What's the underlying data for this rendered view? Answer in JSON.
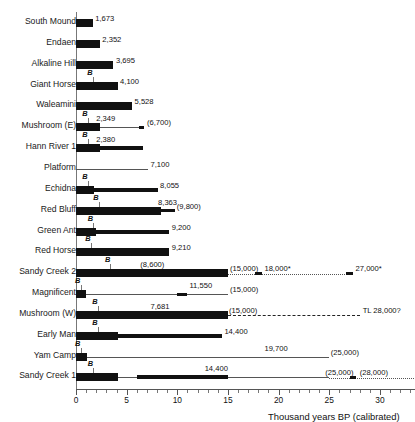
{
  "chart_data": {
    "type": "bar",
    "title": "",
    "xlabel": "Thousand years BP (calibrated)",
    "ylabel": "",
    "xlim": [
      0,
      33.5
    ],
    "xticks": [
      0,
      5,
      10,
      15,
      20,
      25,
      30
    ],
    "xticklabels": [
      "0",
      "5",
      "10",
      "15",
      "20",
      "25",
      "30"
    ],
    "grid": false,
    "legend": null,
    "note": "Horizontal range chart of archaeological site dates; 'B' marks a basal/boundary tick; parenthesised values are uncertain/bracketed estimates; dotted and dashed extensions are inferred older ages.",
    "categories": [
      "South Mound",
      "Endaen",
      "Alkaline Hill",
      "Giant Horse",
      "Waleamini",
      "Mushroom (E)",
      "Hann River 1",
      "Platform",
      "Echidna",
      "Red Bluff",
      "Green Ant",
      "Red Horse",
      "Sandy Creek 2",
      "Magnificent",
      "Mushroom (W)",
      "Early Man",
      "Yam Camp",
      "Sandy Creek 1"
    ],
    "values": [
      1.673,
      2.352,
      3.695,
      4.1,
      5.528,
      2.349,
      2.38,
      7.1,
      8.055,
      8.363,
      9.2,
      9.21,
      15.0,
      11.55,
      15.0,
      14.4,
      19.7,
      14.4
    ],
    "rows": [
      {
        "label": "South Mound",
        "b_marker": null,
        "segments": [
          {
            "kind": "thick",
            "x0": 0,
            "x1": 1.673
          }
        ],
        "labels": [
          {
            "text": "1,673",
            "x": 1.9,
            "align": "left"
          }
        ]
      },
      {
        "label": "Endaen",
        "b_marker": null,
        "segments": [
          {
            "kind": "thick",
            "x0": 0,
            "x1": 2.352
          }
        ],
        "labels": [
          {
            "text": "2,352",
            "x": 2.6,
            "align": "left"
          }
        ]
      },
      {
        "label": "Alkaline Hill",
        "b_marker": null,
        "segments": [
          {
            "kind": "thick",
            "x0": 0,
            "x1": 3.695
          }
        ],
        "labels": [
          {
            "text": "3,695",
            "x": 3.95,
            "align": "left"
          }
        ]
      },
      {
        "label": "Giant Horse",
        "b_marker": 1.65,
        "segments": [
          {
            "kind": "thick",
            "x0": 0,
            "x1": 4.1
          }
        ],
        "labels": [
          {
            "text": "4,100",
            "x": 4.35,
            "align": "left"
          }
        ]
      },
      {
        "label": "Waleamini",
        "b_marker": null,
        "segments": [
          {
            "kind": "thick",
            "x0": 0,
            "x1": 5.528
          }
        ],
        "labels": [
          {
            "text": "5,528",
            "x": 5.78,
            "align": "left"
          }
        ]
      },
      {
        "label": "Mushroom (E)",
        "b_marker": 1.15,
        "segments": [
          {
            "kind": "thick",
            "x0": 0,
            "x1": 2.349
          },
          {
            "kind": "thin",
            "x0": 2.349,
            "x1": 6.7
          },
          {
            "kind": "cap",
            "x0": 6.25,
            "x1": 6.7
          }
        ],
        "labels": [
          {
            "text": "2,349",
            "x": 2.0,
            "align": "left",
            "above": true
          },
          {
            "text": "(6,700)",
            "x": 7.0,
            "align": "left"
          }
        ]
      },
      {
        "label": "Hann River 1",
        "b_marker": 1.15,
        "segments": [
          {
            "kind": "thick",
            "x0": 0,
            "x1": 2.38
          },
          {
            "kind": "med",
            "x0": 2.38,
            "x1": 6.6
          }
        ],
        "labels": [
          {
            "text": "2,380",
            "x": 2.0,
            "align": "left",
            "above": true
          }
        ]
      },
      {
        "label": "Platform",
        "b_marker": null,
        "segments": [
          {
            "kind": "thin",
            "x0": 0,
            "x1": 7.1
          }
        ],
        "labels": [
          {
            "text": "7,100",
            "x": 7.35,
            "align": "left"
          }
        ]
      },
      {
        "label": "Echidna",
        "b_marker": 1.15,
        "segments": [
          {
            "kind": "thick",
            "x0": 0,
            "x1": 1.75
          },
          {
            "kind": "med",
            "x0": 1.75,
            "x1": 8.055
          }
        ],
        "labels": [
          {
            "text": "8,055",
            "x": 8.3,
            "align": "left"
          }
        ]
      },
      {
        "label": "Red Bluff",
        "b_marker": 2.25,
        "segments": [
          {
            "kind": "thick",
            "x0": 0,
            "x1": 8.363
          },
          {
            "kind": "thin",
            "x0": 8.363,
            "x1": 9.8
          },
          {
            "kind": "cap",
            "x0": 8.363,
            "x1": 9.8
          }
        ],
        "labels": [
          {
            "text": "8,363",
            "x": 8.1,
            "align": "left",
            "above": true
          },
          {
            "text": "(9,800)",
            "x": 9.95,
            "align": "left"
          }
        ]
      },
      {
        "label": "Green Ant",
        "b_marker": 1.7,
        "segments": [
          {
            "kind": "thick",
            "x0": 0,
            "x1": 1.95
          },
          {
            "kind": "med",
            "x0": 1.95,
            "x1": 9.2
          }
        ],
        "labels": [
          {
            "text": "9,200",
            "x": 9.45,
            "align": "left"
          }
        ]
      },
      {
        "label": "Red Horse",
        "b_marker": 1.45,
        "segments": [
          {
            "kind": "thick",
            "x0": 0,
            "x1": 9.21
          }
        ],
        "labels": [
          {
            "text": "9,210",
            "x": 9.45,
            "align": "left"
          }
        ]
      },
      {
        "label": "Sandy Creek 2",
        "b_marker": 3.4,
        "segments": [
          {
            "kind": "thick",
            "x0": 0,
            "x1": 15.0
          },
          {
            "kind": "dotted",
            "x0": 15.0,
            "x1": 27.3
          },
          {
            "kind": "cap",
            "x0": 17.7,
            "x1": 18.35
          },
          {
            "kind": "cap",
            "x0": 26.7,
            "x1": 27.35
          }
        ],
        "labels": [
          {
            "text": "(8,600)",
            "x": 6.35,
            "align": "left",
            "above": true
          },
          {
            "text": "(15,000)",
            "x": 15.2,
            "align": "left"
          },
          {
            "text": "18,000*",
            "x": 18.6,
            "align": "left"
          },
          {
            "text": "27,000*",
            "x": 27.6,
            "align": "left"
          }
        ]
      },
      {
        "label": "Magnificent",
        "b_marker": 0.45,
        "segments": [
          {
            "kind": "thick",
            "x0": 0,
            "x1": 0.95
          },
          {
            "kind": "thin",
            "x0": 0.95,
            "x1": 15.0
          },
          {
            "kind": "cap",
            "x0": 10.0,
            "x1": 10.95
          }
        ],
        "labels": [
          {
            "text": "11,550",
            "x": 11.2,
            "align": "left",
            "above": true
          },
          {
            "text": "(15,000)",
            "x": 15.2,
            "align": "left"
          }
        ]
      },
      {
        "label": "Mushroom (W)",
        "b_marker": 2.15,
        "segments": [
          {
            "kind": "thick",
            "x0": 0,
            "x1": 15.0
          },
          {
            "kind": "dashed",
            "x0": 15.0,
            "x1": 28.0
          }
        ],
        "labels": [
          {
            "text": "7,681",
            "x": 7.35,
            "align": "left",
            "above": true
          },
          {
            "text": "(15,000)",
            "x": 15.1,
            "align": "left"
          },
          {
            "text": "TL 28,000?",
            "x": 28.3,
            "align": "left"
          }
        ]
      },
      {
        "label": "Early Man",
        "b_marker": 2.15,
        "segments": [
          {
            "kind": "thick",
            "x0": 0,
            "x1": 4.15
          },
          {
            "kind": "med",
            "x0": 4.15,
            "x1": 14.4
          }
        ],
        "labels": [
          {
            "text": "14,400",
            "x": 14.65,
            "align": "left"
          }
        ]
      },
      {
        "label": "Yam Camp",
        "b_marker": 0.45,
        "segments": [
          {
            "kind": "thick",
            "x0": 0,
            "x1": 1.05
          },
          {
            "kind": "thin",
            "x0": 1.05,
            "x1": 25.0
          }
        ],
        "labels": [
          {
            "text": "19,700",
            "x": 18.6,
            "align": "left",
            "above": true
          },
          {
            "text": "(25,000)",
            "x": 25.15,
            "align": "left"
          }
        ]
      },
      {
        "label": "Sandy Creek 1",
        "b_marker": 1.7,
        "segments": [
          {
            "kind": "thick",
            "x0": 0,
            "x1": 4.15
          },
          {
            "kind": "thin",
            "x0": 4.15,
            "x1": 25.0
          },
          {
            "kind": "med",
            "x0": 6.05,
            "x1": 15.0
          },
          {
            "kind": "dotted",
            "x0": 25.0,
            "x1": 33.4
          },
          {
            "kind": "cap",
            "x0": 27.0,
            "x1": 27.6
          }
        ],
        "labels": [
          {
            "text": "14,400",
            "x": 12.7,
            "align": "left",
            "above": true
          },
          {
            "text": "(25,000)",
            "x": 24.6,
            "align": "left"
          },
          {
            "text": "(28,000)",
            "x": 28.0,
            "align": "left"
          }
        ]
      }
    ]
  }
}
